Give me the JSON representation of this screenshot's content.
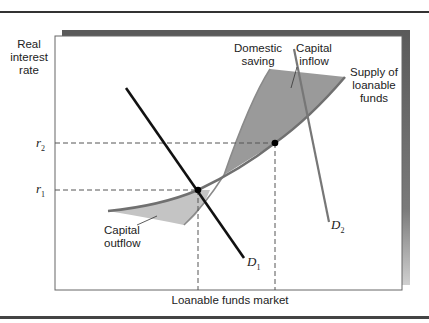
{
  "figure": {
    "y_axis_label": [
      "Real",
      "interest",
      "rate"
    ],
    "x_axis_label": "Loanable funds market",
    "rates": [
      {
        "symbol": "r",
        "sub": "2",
        "y": 143
      },
      {
        "symbol": "r",
        "sub": "1",
        "y": 190
      }
    ],
    "curves": {
      "domestic_saving": {
        "label_line1": "Domestic",
        "label_line2": "saving"
      },
      "capital_inflow": {
        "label_line1": "Capital",
        "label_line2": "inflow"
      },
      "supply": {
        "label_line1": "Supply of",
        "label_line2": "loanable",
        "label_line3": "funds"
      },
      "capital_outflow": {
        "label_line1": "Capital",
        "label_line2": "outflow"
      },
      "demand1": {
        "symbol": "D",
        "sub": "1"
      },
      "demand2": {
        "symbol": "D",
        "sub": "2"
      }
    },
    "colors": {
      "panel_shadow": "#5a5a5a",
      "inflow_fill": "#9a9a9a",
      "outflow_fill": "#c4c4c4",
      "supply_line": "#707070",
      "d1_line": "#111111",
      "d2_line": "#777777",
      "dashed": "#555555"
    }
  }
}
